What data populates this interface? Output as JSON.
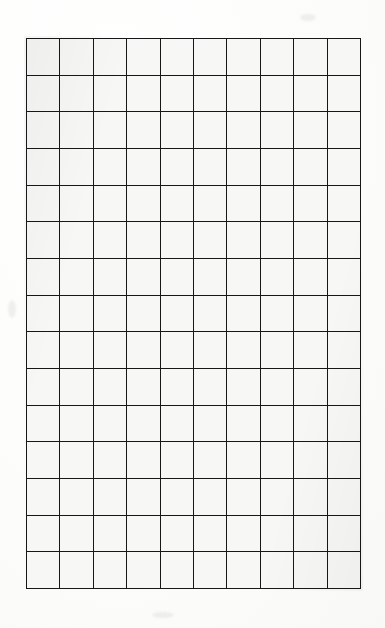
{
  "document": {
    "kind": "grid-paper-sheet",
    "title": "Blank Grid Paper",
    "description": "Scanned sheet of blank squared grid paper with a hand-ruled 10 by 15 cell grid"
  },
  "grid": {
    "columns": 10,
    "rows": 15,
    "total_cells": 150,
    "cell_width_px": 33.5,
    "cell_height_px": 36.7,
    "origin_x_px": 26,
    "origin_y_px": 38,
    "grid_width_px": 335,
    "grid_height_px": 551,
    "line_thickness_px": 3,
    "column_labels": [
      "1",
      "2",
      "3",
      "4",
      "5",
      "6",
      "7",
      "8",
      "9",
      "10"
    ],
    "row_labels": [
      "1",
      "2",
      "3",
      "4",
      "5",
      "6",
      "7",
      "8",
      "9",
      "10",
      "11",
      "12",
      "13",
      "14",
      "15"
    ],
    "cell_contents": [
      [
        "",
        "",
        "",
        "",
        "",
        "",
        "",
        "",
        "",
        ""
      ],
      [
        "",
        "",
        "",
        "",
        "",
        "",
        "",
        "",
        "",
        ""
      ],
      [
        "",
        "",
        "",
        "",
        "",
        "",
        "",
        "",
        "",
        ""
      ],
      [
        "",
        "",
        "",
        "",
        "",
        "",
        "",
        "",
        "",
        ""
      ],
      [
        "",
        "",
        "",
        "",
        "",
        "",
        "",
        "",
        "",
        ""
      ],
      [
        "",
        "",
        "",
        "",
        "",
        "",
        "",
        "",
        "",
        ""
      ],
      [
        "",
        "",
        "",
        "",
        "",
        "",
        "",
        "",
        "",
        ""
      ],
      [
        "",
        "",
        "",
        "",
        "",
        "",
        "",
        "",
        "",
        ""
      ],
      [
        "",
        "",
        "",
        "",
        "",
        "",
        "",
        "",
        "",
        ""
      ],
      [
        "",
        "",
        "",
        "",
        "",
        "",
        "",
        "",
        "",
        ""
      ],
      [
        "",
        "",
        "",
        "",
        "",
        "",
        "",
        "",
        "",
        ""
      ],
      [
        "",
        "",
        "",
        "",
        "",
        "",
        "",
        "",
        "",
        ""
      ],
      [
        "",
        "",
        "",
        "",
        "",
        "",
        "",
        "",
        "",
        ""
      ],
      [
        "",
        "",
        "",
        "",
        "",
        "",
        "",
        "",
        "",
        ""
      ],
      [
        "",
        "",
        "",
        "",
        "",
        "",
        "",
        "",
        "",
        ""
      ]
    ]
  },
  "colors": {
    "page_background": "#fdfdfc",
    "paper": "#fbfbf9",
    "cell_fill": "#f7f7f5",
    "grid_line": "#171717"
  }
}
